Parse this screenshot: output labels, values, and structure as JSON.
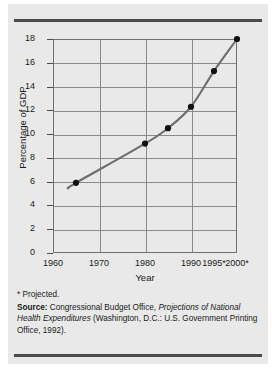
{
  "figure": {
    "background_color": "#e9e9e9",
    "rule_color": "#4a4a4a"
  },
  "chart_data": {
    "type": "line",
    "title": "",
    "subtitle": "",
    "xlabel": "Year",
    "ylabel": "Percentage of GDP",
    "xlim": [
      1960,
      2000
    ],
    "ylim": [
      0,
      18
    ],
    "ytick_labels": [
      "18",
      "16",
      "14",
      "12",
      "10",
      "8",
      "6",
      "4",
      "2",
      "0"
    ],
    "ytick_values": [
      18,
      16,
      14,
      12,
      10,
      8,
      6,
      4,
      2,
      0
    ],
    "xtick_labels": [
      "1960",
      "1970",
      "1980",
      "1990",
      "1995*",
      "2000*"
    ],
    "xtick_values": [
      1960,
      1970,
      1980,
      1990,
      1995,
      2000
    ],
    "gridlines_vertical_at": [
      1970,
      1980,
      1990
    ],
    "grid": true,
    "legend": "none",
    "line_color": "#6e6e6e",
    "marker_color": "#111111",
    "x": [
      1965,
      1980,
      1985,
      1990,
      1995,
      2000
    ],
    "values": [
      5.9,
      9.2,
      10.5,
      12.3,
      15.3,
      18.0
    ],
    "series": [
      {
        "name": "National health expenditures as percentage of GDP",
        "points": [
          {
            "x": 1965,
            "y": 5.9
          },
          {
            "x": 1980,
            "y": 9.2
          },
          {
            "x": 1985,
            "y": 10.5
          },
          {
            "x": 1990,
            "y": 12.3
          },
          {
            "x": 1995,
            "y": 15.3
          },
          {
            "x": 2000,
            "y": 18.0
          }
        ]
      }
    ],
    "annotations": [
      "* Projected."
    ]
  },
  "notes": {
    "footnote": "* Projected.",
    "source_label": "Source:",
    "source_part1": " Congressional Budget Office, ",
    "source_italic1": "Projections of National Health Expenditures",
    "source_part2": " (Washington, D.C.: U.S. Government Printing Office, 1992)."
  }
}
